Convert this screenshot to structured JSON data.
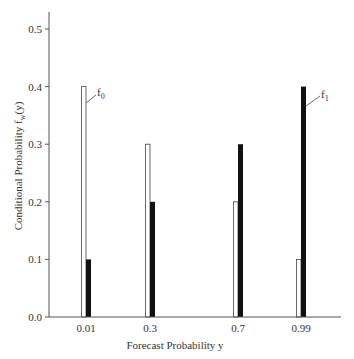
{
  "chart_data": {
    "type": "bar",
    "title": "",
    "xlabel": "Forecast Probability y",
    "ylabel": "Conditional Probability f_w(y)",
    "ylabel_parts": {
      "main": "Conditional Probability f",
      "sub": "w",
      "tail": "(y)"
    },
    "categories": [
      "0.01",
      "0.3",
      "0.7",
      "0.99"
    ],
    "series": [
      {
        "name": "f0",
        "fill": "#ffffff",
        "stroke": "#444444",
        "values": [
          0.4,
          0.3,
          0.2,
          0.1
        ]
      },
      {
        "name": "f1",
        "fill": "#111111",
        "stroke": "#111111",
        "values": [
          0.1,
          0.2,
          0.3,
          0.4
        ]
      }
    ],
    "ylim": [
      0.0,
      0.53
    ],
    "yticks": [
      "0.0",
      "0.1",
      "0.2",
      "0.3",
      "0.4",
      "0.5"
    ],
    "grid": false,
    "annotations": [
      {
        "label": "f",
        "sub": "0",
        "series": "f0"
      },
      {
        "label": "f",
        "sub": "1",
        "series": "f1"
      }
    ]
  }
}
